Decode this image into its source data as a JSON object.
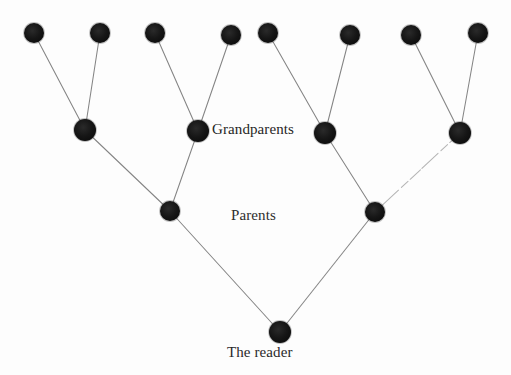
{
  "diagram": {
    "type": "family-tree",
    "title": "",
    "background_color": "#fdfdfd",
    "node_color": "#141414",
    "edge_color": "#6e6e6e",
    "text_color": "#2b2b2b",
    "labels": {
      "grandparents": "Grandparents",
      "parents": "Parents",
      "reader": "The reader"
    },
    "generations": [
      {
        "name": "great-grandparents",
        "label": "",
        "y": 33,
        "node_radius": 10,
        "nodes": [
          {
            "id": "ggp1",
            "x": 34,
            "y": 33
          },
          {
            "id": "ggp2",
            "x": 100,
            "y": 33
          },
          {
            "id": "ggp3",
            "x": 155,
            "y": 33
          },
          {
            "id": "ggp4",
            "x": 231,
            "y": 35
          },
          {
            "id": "ggp5",
            "x": 268,
            "y": 33
          },
          {
            "id": "ggp6",
            "x": 350,
            "y": 35
          },
          {
            "id": "ggp7",
            "x": 411,
            "y": 35
          },
          {
            "id": "ggp8",
            "x": 478,
            "y": 33
          }
        ]
      },
      {
        "name": "grandparents",
        "label": "Grandparents",
        "y": 131,
        "node_radius": 11,
        "nodes": [
          {
            "id": "gp1",
            "x": 85,
            "y": 130
          },
          {
            "id": "gp2",
            "x": 198,
            "y": 131
          },
          {
            "id": "gp3",
            "x": 325,
            "y": 133
          },
          {
            "id": "gp4",
            "x": 460,
            "y": 133
          }
        ]
      },
      {
        "name": "parents",
        "label": "Parents",
        "y": 211,
        "node_radius": 10,
        "nodes": [
          {
            "id": "p1",
            "x": 170,
            "y": 211
          },
          {
            "id": "p2",
            "x": 375,
            "y": 212
          }
        ]
      },
      {
        "name": "reader",
        "label": "The reader",
        "y": 332,
        "node_radius": 11,
        "nodes": [
          {
            "id": "reader",
            "x": 280,
            "y": 332
          }
        ]
      }
    ],
    "edges": [
      {
        "from": "ggp1",
        "to": "gp1",
        "style": "solid"
      },
      {
        "from": "ggp2",
        "to": "gp1",
        "style": "solid"
      },
      {
        "from": "ggp3",
        "to": "gp2",
        "style": "solid"
      },
      {
        "from": "ggp4",
        "to": "gp2",
        "style": "solid"
      },
      {
        "from": "ggp5",
        "to": "gp3",
        "style": "solid"
      },
      {
        "from": "ggp6",
        "to": "gp3",
        "style": "solid"
      },
      {
        "from": "ggp7",
        "to": "gp4",
        "style": "solid"
      },
      {
        "from": "ggp8",
        "to": "gp4",
        "style": "solid"
      },
      {
        "from": "gp1",
        "to": "p1",
        "style": "solid"
      },
      {
        "from": "gp2",
        "to": "p1",
        "style": "solid"
      },
      {
        "from": "gp3",
        "to": "p2",
        "style": "solid"
      },
      {
        "from": "gp4",
        "to": "p2",
        "style": "faded"
      },
      {
        "from": "p1",
        "to": "reader",
        "style": "solid"
      },
      {
        "from": "p2",
        "to": "reader",
        "style": "solid"
      }
    ]
  }
}
